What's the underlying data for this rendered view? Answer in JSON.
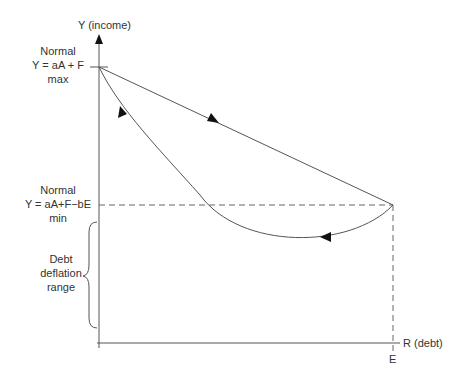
{
  "diagram": {
    "y_axis_label": "Y (income)",
    "x_axis_label": "R (debt)",
    "x_tick_label": "E",
    "max_label": {
      "line1": "Normal",
      "line2": "Y = aA + F",
      "line3": "max"
    },
    "min_label": {
      "line1": "Normal",
      "line2": "Y = aA+F−bE",
      "line3": "min"
    },
    "range_label": {
      "line1": "Debt",
      "line2": "deflation",
      "line3": "range"
    },
    "colors": {
      "line": "#555555",
      "dashed": "#666666",
      "text": "#333333"
    }
  }
}
